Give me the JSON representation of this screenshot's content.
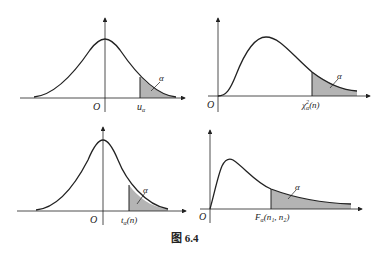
{
  "figure": {
    "caption": "图 6.4",
    "caption_prefix": "图",
    "caption_number": "6.4",
    "colors": {
      "line": "#222222",
      "shade": "#b4b4b4"
    }
  },
  "panels": [
    {
      "id": "normal",
      "distribution": "standard normal",
      "origin": "O",
      "quantile": "u",
      "quantile_sub": "α",
      "area": "α"
    },
    {
      "id": "chi2",
      "distribution": "chi-square",
      "origin": "O",
      "quantile": "χ",
      "quantile_sup": "2",
      "quantile_sub": "α",
      "quantile_arg": "(n)",
      "area": "α"
    },
    {
      "id": "t",
      "distribution": "Student t",
      "origin": "O",
      "quantile": "t",
      "quantile_sub": "α",
      "quantile_arg": "(n)",
      "area": "α"
    },
    {
      "id": "f",
      "distribution": "F",
      "origin": "O",
      "quantile": "F",
      "quantile_sub": "α",
      "quantile_arg": "(n₁, n₂)",
      "area": "α"
    }
  ]
}
